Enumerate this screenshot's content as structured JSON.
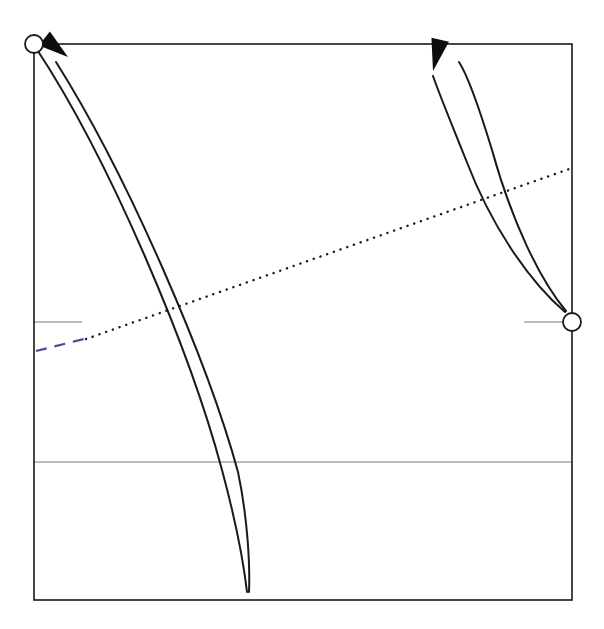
{
  "figure": {
    "background_color": "#ffffff",
    "width": 604,
    "height": 629
  },
  "frame": {
    "name": "plot-frame",
    "x0": 34,
    "y0": 44,
    "x1": 572,
    "y1": 600,
    "stroke": "#1a1a1a",
    "stroke_width": 1.6,
    "fill": "none"
  },
  "gridlines": [
    {
      "name": "horizontal-gridline",
      "orientation": "horizontal",
      "x0": 34,
      "y0": 462,
      "x1": 572,
      "y1": 462,
      "stroke": "#7a7a7a",
      "stroke_width": 1.0
    }
  ],
  "ticks": [
    {
      "name": "left-axis-tick",
      "side": "left",
      "x0": 34,
      "y0": 322,
      "x1": 82,
      "y1": 322,
      "stroke": "#7a7a7a",
      "stroke_width": 1.2
    },
    {
      "name": "right-axis-tick",
      "side": "right",
      "x0": 524,
      "y0": 322,
      "x1": 572,
      "y1": 322,
      "stroke": "#7a7a7a",
      "stroke_width": 1.2
    }
  ],
  "markers": [
    {
      "name": "fixed-point-upper-left",
      "cx": 34,
      "cy": 44,
      "r": 9,
      "stroke": "#1a1a1a",
      "stroke_width": 1.8,
      "fill": "#ffffff"
    },
    {
      "name": "fixed-point-right",
      "cx": 572,
      "cy": 322,
      "r": 9,
      "stroke": "#1a1a1a",
      "stroke_width": 1.8,
      "fill": "#ffffff"
    }
  ],
  "curves": [
    {
      "name": "trajectory-left-outer",
      "stroke": "#1a1a1a",
      "stroke_width": 2.0,
      "path": "M 36 48 C 110 160 190 350 222 470 C 236 522 244 566 247 592",
      "direction": "up-left"
    },
    {
      "name": "trajectory-left-inner",
      "stroke": "#1a1a1a",
      "stroke_width": 2.0,
      "path": "M 56 62 C 128 176 208 362 238 472 C 248 520 250 566 249 592",
      "direction": "up-left"
    },
    {
      "name": "trajectory-right-outer",
      "stroke": "#1a1a1a",
      "stroke_width": 2.0,
      "path": "M 565 312 C 530 282 492 228 466 160 C 450 120 440 96 433 76",
      "direction": "up"
    },
    {
      "name": "trajectory-right-inner",
      "stroke": "#1a1a1a",
      "stroke_width": 2.0,
      "path": "M 566 311 C 540 280 512 222 492 150 C 478 104 468 76 459 62",
      "direction": "up"
    }
  ],
  "arrows": [
    {
      "name": "arrowhead-upper-left",
      "tip_x": 68,
      "tip_y": 57,
      "angle_deg": 218,
      "length": 30,
      "half_width": 9,
      "fill": "#0d0d0d"
    },
    {
      "name": "arrowhead-upper-right",
      "tip_x": 433,
      "tip_y": 71,
      "angle_deg": 283,
      "length": 32,
      "half_width": 9,
      "fill": "#0d0d0d"
    }
  ],
  "separatrix": {
    "name": "separatrix-line",
    "dotted_segment": {
      "name": "separatrix-dotted-black",
      "x0": 86,
      "y0": 339,
      "x1": 572,
      "y1": 168,
      "stroke": "#1a1a1a",
      "stroke_width": 2.4,
      "dash_pattern": "0.1 7"
    },
    "dashed_segment": {
      "name": "separatrix-dashed-blue",
      "x0": 36,
      "y0": 351,
      "x1": 92,
      "y1": 337,
      "stroke": "#4a4a8c",
      "stroke_width": 2.2,
      "dash_pattern": "11 8"
    }
  },
  "chart_data": {
    "type": "line",
    "xlabel": "",
    "ylabel": "",
    "xlim": [
      34,
      572
    ],
    "ylim": [
      600,
      44
    ],
    "grid": true,
    "legend_position": "none",
    "annotations": [
      "open circle marker at upper-left corner (34, 44)",
      "open circle marker on right border (572, 322)",
      "black dotted separatrix rising left-to-right",
      "blue dashed continuation of separatrix at left edge",
      "arrowhead pointing up-left on left trajectory pair",
      "arrowhead pointing up on right trajectory pair"
    ],
    "series": [
      {
        "name": "trajectory-left-outer",
        "x": [
          36,
          110,
          160,
          200,
          222,
          238,
          247
        ],
        "y": [
          48,
          160,
          270,
          390,
          470,
          540,
          592
        ]
      },
      {
        "name": "trajectory-left-inner",
        "x": [
          56,
          128,
          182,
          218,
          238,
          246,
          249
        ],
        "y": [
          62,
          176,
          290,
          400,
          472,
          540,
          592
        ]
      },
      {
        "name": "trajectory-right-outer",
        "x": [
          565,
          530,
          500,
          470,
          450,
          437,
          433
        ],
        "y": [
          312,
          282,
          238,
          170,
          120,
          90,
          76
        ]
      },
      {
        "name": "trajectory-right-inner",
        "x": [
          566,
          540,
          518,
          496,
          478,
          466,
          459
        ],
        "y": [
          311,
          280,
          228,
          160,
          110,
          80,
          62
        ]
      },
      {
        "name": "separatrix",
        "x": [
          36,
          86,
          200,
          350,
          480,
          572
        ],
        "y": [
          351,
          339,
          299,
          246,
          200,
          168
        ]
      }
    ]
  }
}
